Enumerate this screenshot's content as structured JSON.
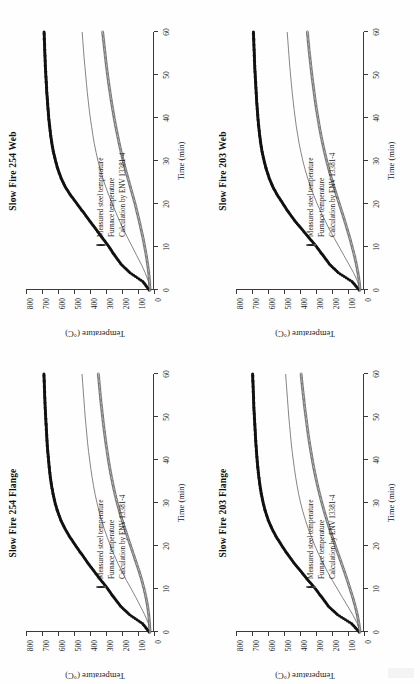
{
  "page": {
    "background": "#fefefe",
    "layout": "2x2 grid of rotated charts",
    "rotation_note": "charts rotated 90 degrees counter-clockwise on the page"
  },
  "legend": {
    "measured_label": "Measured steel temperature",
    "furnace_label": "Furnace temperature",
    "calculation_label": "Calculation by ENV 13381-4",
    "measured_marker": "open-circle-marker",
    "furnace_marker": "filled-circle-marker",
    "calculation_marker": "solid-line-marker"
  },
  "axes": {
    "xlabel": "Time (min)",
    "ylabel": "Temperature (°C)",
    "xticks": [
      "0",
      "10",
      "20",
      "30",
      "40",
      "50",
      "60"
    ],
    "yticks": [
      "0",
      "100",
      "200",
      "300",
      "400",
      "500",
      "600",
      "700",
      "800"
    ],
    "xlim": [
      0,
      60
    ],
    "ylim": [
      0,
      800
    ]
  },
  "colors": {
    "measured": "#2b2b2b",
    "furnace": "#111111",
    "calculation": "#777777",
    "axis": "#3a3a3a"
  },
  "chart_data": [
    {
      "type": "line",
      "panel": "top-left",
      "title": "Slow Fire 254 Web",
      "xlabel": "Time (min)",
      "ylabel": "Temperature (°C)",
      "xlim": [
        0,
        60
      ],
      "ylim": [
        0,
        800
      ],
      "grid": false,
      "legend_position": "inside lower-right",
      "x": [
        0,
        2,
        4,
        6,
        8,
        10,
        12,
        14,
        16,
        18,
        20,
        22,
        24,
        26,
        28,
        30,
        32,
        34,
        36,
        38,
        40,
        42,
        44,
        46,
        48,
        50,
        52,
        54,
        56,
        58,
        60
      ],
      "series": [
        {
          "name": "Furnace temperature",
          "marker": "filled-circle",
          "values": [
            30,
            70,
            150,
            205,
            245,
            280,
            320,
            360,
            400,
            440,
            480,
            520,
            555,
            580,
            600,
            615,
            628,
            638,
            646,
            652,
            658,
            662,
            666,
            670,
            673,
            676,
            679,
            681,
            683,
            685,
            687
          ]
        },
        {
          "name": "Calculation by ENV 13381-4",
          "marker": "line",
          "values": [
            25,
            35,
            55,
            80,
            108,
            135,
            163,
            190,
            215,
            238,
            260,
            282,
            302,
            320,
            336,
            350,
            362,
            373,
            382,
            390,
            398,
            405,
            411,
            417,
            422,
            427,
            432,
            437,
            441,
            445,
            449
          ]
        },
        {
          "name": "Measured steel temperature",
          "marker": "open-circle",
          "values": [
            25,
            28,
            33,
            40,
            48,
            58,
            68,
            80,
            92,
            105,
            118,
            133,
            148,
            163,
            178,
            192,
            205,
            217,
            228,
            239,
            249,
            258,
            267,
            275,
            283,
            290,
            297,
            303,
            309,
            315,
            321
          ]
        }
      ]
    },
    {
      "type": "line",
      "panel": "top-right",
      "title": "Slow Fire 203 Web",
      "xlabel": "Time (min)",
      "ylabel": "Temperature (°C)",
      "xlim": [
        0,
        60
      ],
      "ylim": [
        0,
        800
      ],
      "grid": false,
      "legend_position": "inside lower-right",
      "x": [
        0,
        2,
        4,
        6,
        8,
        10,
        12,
        14,
        16,
        18,
        20,
        22,
        24,
        26,
        28,
        30,
        32,
        34,
        36,
        38,
        40,
        42,
        44,
        46,
        48,
        50,
        52,
        54,
        56,
        58,
        60
      ],
      "series": [
        {
          "name": "Furnace temperature",
          "marker": "filled-circle",
          "values": [
            30,
            75,
            160,
            215,
            255,
            295,
            340,
            385,
            430,
            470,
            505,
            540,
            570,
            592,
            610,
            624,
            636,
            645,
            652,
            658,
            663,
            667,
            671,
            674,
            677,
            680,
            683,
            685,
            687,
            689,
            691
          ]
        },
        {
          "name": "Calculation by ENV 13381-4",
          "marker": "line",
          "values": [
            25,
            40,
            65,
            95,
            125,
            155,
            185,
            215,
            242,
            268,
            292,
            314,
            334,
            352,
            368,
            382,
            394,
            405,
            414,
            423,
            430,
            437,
            443,
            449,
            454,
            459,
            464,
            468,
            472,
            476,
            480
          ]
        },
        {
          "name": "Measured steel temperature",
          "marker": "open-circle",
          "values": [
            25,
            30,
            38,
            48,
            60,
            74,
            88,
            104,
            120,
            137,
            154,
            171,
            188,
            204,
            219,
            233,
            246,
            258,
            269,
            279,
            288,
            297,
            305,
            312,
            319,
            326,
            332,
            338,
            344,
            349,
            354
          ]
        }
      ]
    },
    {
      "type": "line",
      "panel": "bottom-left",
      "title": "Slow Fire 254 Flange",
      "xlabel": "Time (min)",
      "ylabel": "Temperature (°C)",
      "xlim": [
        0,
        60
      ],
      "ylim": [
        0,
        800
      ],
      "grid": false,
      "legend_position": "inside lower-right",
      "x": [
        0,
        2,
        4,
        6,
        8,
        10,
        12,
        14,
        16,
        18,
        20,
        22,
        24,
        26,
        28,
        30,
        32,
        34,
        36,
        38,
        40,
        42,
        44,
        46,
        48,
        50,
        52,
        54,
        56,
        58,
        60
      ],
      "series": [
        {
          "name": "Furnace temperature",
          "marker": "filled-circle",
          "values": [
            30,
            72,
            152,
            208,
            250,
            288,
            330,
            372,
            412,
            450,
            488,
            524,
            556,
            582,
            602,
            618,
            630,
            640,
            648,
            654,
            659,
            664,
            668,
            671,
            674,
            677,
            680,
            682,
            684,
            686,
            688
          ]
        },
        {
          "name": "Calculation by ENV 13381-4",
          "marker": "line",
          "values": [
            25,
            35,
            58,
            85,
            113,
            142,
            172,
            200,
            226,
            250,
            272,
            292,
            311,
            328,
            343,
            356,
            368,
            378,
            387,
            395,
            402,
            409,
            415,
            420,
            425,
            430,
            434,
            438,
            442,
            446,
            450
          ]
        },
        {
          "name": "Measured steel temperature",
          "marker": "open-circle",
          "values": [
            25,
            28,
            33,
            40,
            50,
            62,
            76,
            92,
            110,
            128,
            146,
            164,
            182,
            199,
            215,
            230,
            243,
            255,
            266,
            276,
            285,
            293,
            301,
            308,
            315,
            321,
            327,
            333,
            338,
            343,
            348
          ]
        }
      ]
    },
    {
      "type": "line",
      "panel": "bottom-right",
      "title": "Slow Fire 203 Flange",
      "xlabel": "Time (min)",
      "ylabel": "Temperature (°C)",
      "xlim": [
        0,
        60
      ],
      "ylim": [
        0,
        800
      ],
      "grid": false,
      "legend_position": "inside lower-right",
      "x": [
        0,
        2,
        4,
        6,
        8,
        10,
        12,
        14,
        16,
        18,
        20,
        22,
        24,
        26,
        28,
        30,
        32,
        34,
        36,
        38,
        40,
        42,
        44,
        46,
        48,
        50,
        52,
        54,
        56,
        58,
        60
      ],
      "series": [
        {
          "name": "Furnace temperature",
          "marker": "filled-circle",
          "values": [
            30,
            78,
            165,
            222,
            262,
            302,
            348,
            392,
            436,
            476,
            512,
            546,
            575,
            598,
            616,
            630,
            641,
            650,
            657,
            663,
            668,
            672,
            676,
            679,
            682,
            685,
            688,
            690,
            692,
            694,
            696
          ]
        },
        {
          "name": "Calculation by ENV 13381-4",
          "marker": "line",
          "values": [
            25,
            42,
            70,
            102,
            134,
            166,
            198,
            228,
            256,
            282,
            306,
            328,
            348,
            366,
            382,
            396,
            408,
            418,
            427,
            435,
            442,
            449,
            455,
            460,
            465,
            470,
            474,
            478,
            482,
            486,
            490
          ]
        },
        {
          "name": "Measured steel temperature",
          "marker": "open-circle",
          "values": [
            25,
            32,
            42,
            55,
            70,
            87,
            104,
            122,
            141,
            160,
            179,
            197,
            215,
            232,
            248,
            263,
            277,
            290,
            302,
            313,
            323,
            332,
            341,
            349,
            356,
            363,
            370,
            376,
            382,
            388,
            393
          ]
        }
      ]
    }
  ]
}
